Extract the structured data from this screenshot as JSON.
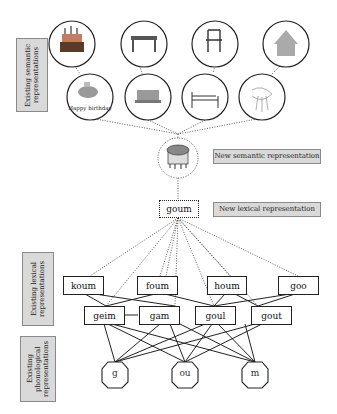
{
  "labels": {
    "semantic": "Existing semantic representations",
    "lexical": "Existing lexical representations",
    "phonological": "Existing phonological representations",
    "new_semantic": "New semantic representation",
    "new_lexical": "New lexical representation"
  },
  "pictures": {
    "top_row": [
      "cake-icon",
      "table-icon",
      "chair-icon",
      "house-icon"
    ],
    "bottom_row": [
      "birthday-gift-icon",
      "cradle-icon",
      "bed-icon",
      "fish-icon"
    ],
    "birthday_caption": "Happy birthday",
    "new_item": "novel-object-icon"
  },
  "new_word": "goum",
  "lexical_top": [
    "koum",
    "foum",
    "houm",
    "goo"
  ],
  "lexical_bottom": [
    "geim",
    "gam",
    "goul",
    "gout"
  ],
  "phonemes": [
    "g",
    "ou",
    "m"
  ]
}
